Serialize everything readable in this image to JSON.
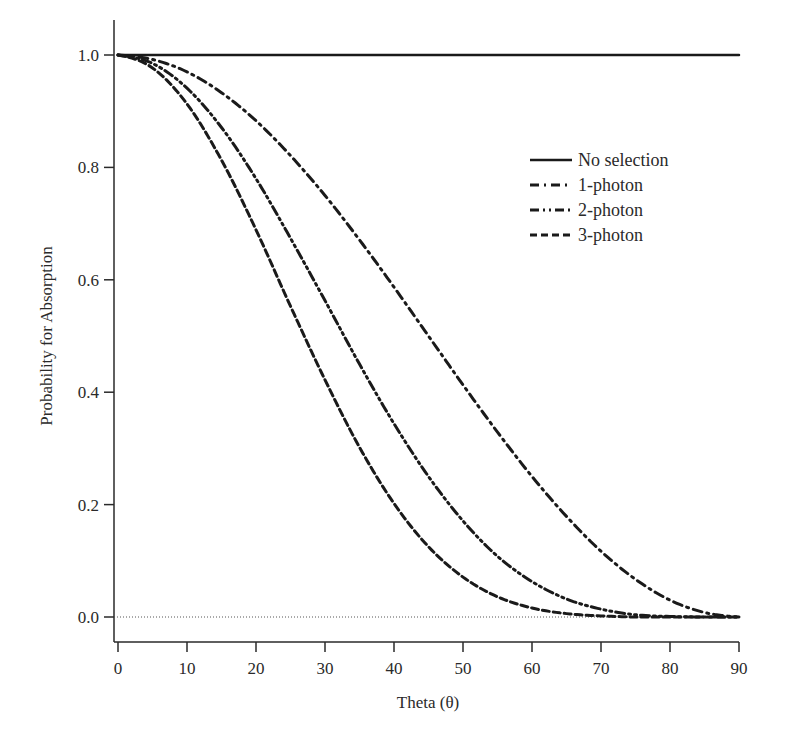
{
  "chart_data": {
    "type": "line",
    "title": "",
    "xlabel": "Theta (θ)",
    "ylabel": "Probability for Absorption",
    "xlim": [
      0,
      90
    ],
    "ylim": [
      0.0,
      1.0
    ],
    "xticks": [
      0,
      10,
      20,
      30,
      40,
      50,
      60,
      70,
      80,
      90
    ],
    "yticks": [
      "0.0",
      "0.2",
      "0.4",
      "0.6",
      "0.8",
      "1.0"
    ],
    "grid": false,
    "reference_line": {
      "y": 0.0,
      "style": "dotted"
    },
    "legend_position": "upper right",
    "x": [
      0,
      5,
      10,
      15,
      20,
      25,
      30,
      35,
      40,
      45,
      50,
      55,
      60,
      65,
      70,
      75,
      80,
      85,
      90
    ],
    "series": [
      {
        "name": "No selection",
        "style": "solid",
        "values": [
          1.0,
          1.0,
          1.0,
          1.0,
          1.0,
          1.0,
          1.0,
          1.0,
          1.0,
          1.0,
          1.0,
          1.0,
          1.0,
          1.0,
          1.0,
          1.0,
          1.0,
          1.0,
          1.0
        ]
      },
      {
        "name": "1-photon",
        "style": "dash-dot",
        "values": [
          1.0,
          0.992,
          0.97,
          0.933,
          0.883,
          0.821,
          0.75,
          0.671,
          0.587,
          0.5,
          0.413,
          0.329,
          0.25,
          0.179,
          0.117,
          0.067,
          0.03,
          0.008,
          0.0
        ]
      },
      {
        "name": "2-photon",
        "style": "dash-dot-dot",
        "values": [
          1.0,
          0.985,
          0.941,
          0.871,
          0.78,
          0.674,
          0.563,
          0.45,
          0.344,
          0.25,
          0.171,
          0.108,
          0.063,
          0.032,
          0.014,
          0.004,
          0.001,
          0.0,
          0.0
        ]
      },
      {
        "name": "3-photon",
        "style": "dashed",
        "values": [
          1.0,
          0.977,
          0.913,
          0.813,
          0.689,
          0.553,
          0.422,
          0.302,
          0.202,
          0.125,
          0.071,
          0.036,
          0.016,
          0.006,
          0.002,
          0.0,
          0.0,
          0.0,
          0.0
        ]
      }
    ]
  }
}
